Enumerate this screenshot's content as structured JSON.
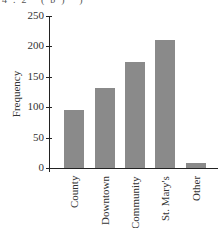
{
  "header_fragment": "4.2   (b) )",
  "chart_data": {
    "type": "bar",
    "title": "",
    "xlabel": "",
    "ylabel": "Frequency",
    "categories": [
      "County",
      "Downtown",
      "Community",
      "St. Mary's",
      "Other"
    ],
    "values": [
      95,
      131,
      174,
      210,
      8
    ],
    "ylim": [
      0,
      250
    ],
    "yticks": [
      0,
      50,
      100,
      150,
      200,
      250
    ],
    "grid": false,
    "legend": null,
    "bar_color": "#8a8a8a"
  }
}
